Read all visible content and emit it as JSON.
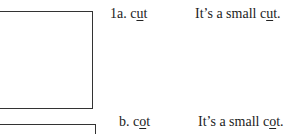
{
  "items": [
    {
      "label": "1a.",
      "word_pre": "c",
      "word_u": "u",
      "word_post": "t",
      "sentence_pre": "It’s a small c",
      "sentence_u": "u",
      "sentence_post": "t."
    },
    {
      "label": "b.",
      "word_pre": "c",
      "word_u": "o",
      "word_post": "t",
      "sentence_pre": "It’s a small c",
      "sentence_u": "o",
      "sentence_post": "t."
    }
  ]
}
